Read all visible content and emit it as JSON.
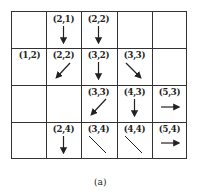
{
  "diagram": {
    "caption": "(a)",
    "grid": {
      "columns": 5,
      "rows": 4,
      "line_color": "#333333"
    },
    "cells": [
      {
        "row": 0,
        "col": 1,
        "label": "(2,1)",
        "arrow": "down"
      },
      {
        "row": 0,
        "col": 2,
        "label": "(2,2)",
        "arrow": "down"
      },
      {
        "row": 1,
        "col": 0,
        "label": "(1,2)",
        "arrow": "none"
      },
      {
        "row": 1,
        "col": 1,
        "label": "(2,2)",
        "arrow": "down-left"
      },
      {
        "row": 1,
        "col": 2,
        "label": "(3,2)",
        "arrow": "down"
      },
      {
        "row": 1,
        "col": 3,
        "label": "(3,3)",
        "arrow": "down-right"
      },
      {
        "row": 2,
        "col": 2,
        "label": "(3,3)",
        "arrow": "down-left"
      },
      {
        "row": 2,
        "col": 3,
        "label": "(4,3)",
        "arrow": "down"
      },
      {
        "row": 2,
        "col": 4,
        "label": "(5,3)",
        "arrow": "right"
      },
      {
        "row": 3,
        "col": 1,
        "label": "(2,4)",
        "arrow": "down"
      },
      {
        "row": 3,
        "col": 2,
        "label": "(3,4)",
        "arrow": "diagonal-line"
      },
      {
        "row": 3,
        "col": 3,
        "label": "(4,4)",
        "arrow": "diagonal-line"
      },
      {
        "row": 3,
        "col": 4,
        "label": "(5,4)",
        "arrow": "right"
      }
    ]
  }
}
